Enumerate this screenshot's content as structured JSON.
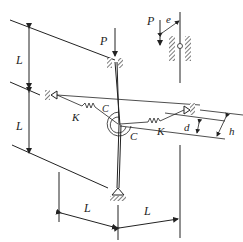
{
  "figure": {
    "type": "structural mechanics diagram",
    "labels": {
      "load_main": "P",
      "load_inset": "P",
      "eccentricity": "e",
      "length_upper": "L",
      "length_lower": "L",
      "spring_left": "K",
      "spring_right": "K",
      "rotational_spring_left": "C",
      "rotational_spring_right": "C",
      "offset_d": "d",
      "offset_h": "h",
      "horizontal_left": "L",
      "horizontal_right": "L"
    },
    "colors": {
      "line": "#222222",
      "background": "#ffffff"
    }
  }
}
